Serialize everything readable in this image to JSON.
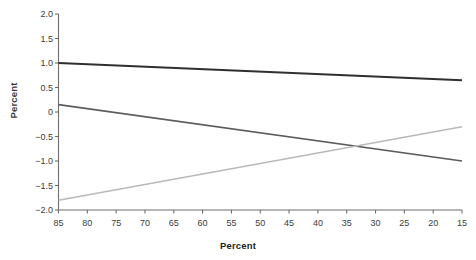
{
  "title_fragment": "",
  "axes": {
    "y_title": "Percent",
    "x_title": "Percent"
  },
  "chart_data": {
    "type": "line",
    "title": "",
    "xlabel": "Percent",
    "ylabel": "Percent",
    "xlim": [
      85,
      15
    ],
    "ylim": [
      -2.0,
      2.0
    ],
    "x_reversed": true,
    "grid": false,
    "legend": "none",
    "xticks": [
      85,
      80,
      75,
      70,
      65,
      60,
      55,
      50,
      45,
      40,
      35,
      30,
      25,
      20,
      15
    ],
    "xtick_labels": [
      "85",
      "80",
      "75",
      "70",
      "65",
      "60",
      "55",
      "50",
      "45",
      "40",
      "35",
      "30",
      "25",
      "20",
      "15"
    ],
    "yticks": [
      2.0,
      1.5,
      1.0,
      0.5,
      0,
      -0.5,
      -1.0,
      -1.5,
      -2.0
    ],
    "ytick_labels": [
      "2.0",
      "1.5",
      "1.0",
      "0.5",
      "0",
      "-0.5",
      "-1.0",
      "-1.5",
      "-2.0"
    ],
    "series": [
      {
        "name": "series-1",
        "color": "#2f2f31",
        "width": 2.0,
        "x": [
          85,
          15
        ],
        "values": [
          1.0,
          0.65
        ]
      },
      {
        "name": "series-2",
        "color": "#5c5c5e",
        "width": 1.6,
        "x": [
          85,
          15
        ],
        "values": [
          0.15,
          -1.0
        ]
      },
      {
        "name": "series-3",
        "color": "#b9b9bb",
        "width": 1.5,
        "x": [
          85,
          15
        ],
        "values": [
          -1.8,
          -0.3
        ]
      }
    ],
    "intersection": {
      "x": 35,
      "y": -0.72
    }
  },
  "colors": {
    "axis": "#6e6e70",
    "tick_text": "#3b3b3d",
    "background": "#ffffff"
  }
}
